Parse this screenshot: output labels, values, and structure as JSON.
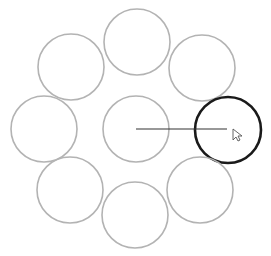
{
  "canvas": {
    "width": 271,
    "height": 256,
    "background": "#ffffff"
  },
  "colors": {
    "circle_stroke": "#b3b3b3",
    "selected_stroke": "#1a1a1a",
    "connector": "#333333",
    "cursor_fill": "#ffffff",
    "cursor_stroke": "#555555"
  },
  "circles": [
    {
      "id": "top",
      "cx": 137,
      "cy": 42,
      "r": 33,
      "selected": false
    },
    {
      "id": "top-left",
      "cx": 71,
      "cy": 67,
      "r": 33,
      "selected": false
    },
    {
      "id": "top-right",
      "cx": 202,
      "cy": 68,
      "r": 33,
      "selected": false
    },
    {
      "id": "left",
      "cx": 44,
      "cy": 129,
      "r": 33,
      "selected": false
    },
    {
      "id": "center",
      "cx": 136,
      "cy": 129,
      "r": 33,
      "selected": false
    },
    {
      "id": "right",
      "cx": 228,
      "cy": 130,
      "r": 33,
      "selected": true
    },
    {
      "id": "bottom-left",
      "cx": 70,
      "cy": 190,
      "r": 33,
      "selected": false
    },
    {
      "id": "bottom",
      "cx": 135,
      "cy": 215,
      "r": 33,
      "selected": false
    },
    {
      "id": "bottom-right",
      "cx": 200,
      "cy": 190,
      "r": 33,
      "selected": false
    }
  ],
  "connector": {
    "x1": 136,
    "y1": 129,
    "x2": 227,
    "y2": 129
  },
  "cursor": {
    "x": 233,
    "y": 129
  }
}
